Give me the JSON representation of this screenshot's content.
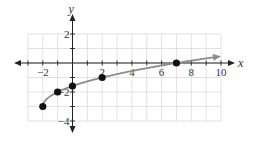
{
  "chart_data": {
    "type": "line",
    "title": "",
    "xlabel": "x",
    "ylabel": "y",
    "xlim": [
      -3,
      10
    ],
    "ylim": [
      -4,
      2
    ],
    "grid": true,
    "x_tick_labels": [
      "-2",
      "2",
      "4",
      "6",
      "8",
      "10"
    ],
    "x_tick_values": [
      -2,
      2,
      4,
      6,
      8,
      10
    ],
    "y_tick_labels": [
      "2",
      "-2",
      "-4"
    ],
    "y_tick_values": [
      2,
      -2,
      -4
    ],
    "series": [
      {
        "name": "f(x) = sqrt(x + 2) - 3",
        "function": "sqrt(x+2)-3",
        "domain": [
          -2,
          10
        ],
        "end_arrow": true,
        "color": "#8c8c8c"
      }
    ],
    "points": [
      {
        "x": -2,
        "y": -3
      },
      {
        "x": -1,
        "y": -2
      },
      {
        "x": 0,
        "y": -1.59
      },
      {
        "x": 2,
        "y": -1
      },
      {
        "x": 7,
        "y": 0
      }
    ],
    "colors": {
      "axis": "#222222",
      "grid": "#d9d9d9",
      "curve": "#8c8c8c",
      "point": "#111111"
    }
  }
}
